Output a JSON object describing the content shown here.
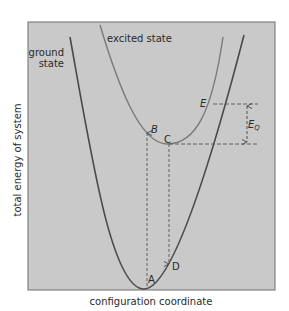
{
  "figure": {
    "axes": {
      "xlabel": "configuration coordinate",
      "ylabel": "total energy of system"
    },
    "curves": {
      "ground_label_line1": "ground",
      "ground_label_line2": "state",
      "excited_label": "excited state"
    },
    "points": {
      "A": "A",
      "B": "B",
      "C": "C",
      "D": "D",
      "E": "E"
    },
    "energy_gap": {
      "label_main": "E",
      "label_sub": "Q"
    },
    "colors": {
      "panel_bg": "#c8c8c8",
      "ground_curve": "#4a4a4a",
      "excited_curve": "#7a7a7a",
      "dashed": "#5a5a5a"
    }
  }
}
